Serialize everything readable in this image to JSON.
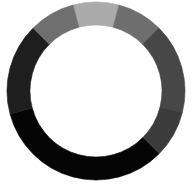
{
  "spinner": {
    "icon": "loading-spinner-icon",
    "center": [
      96,
      91
    ],
    "outer_radius": 89,
    "inner_radius": 66,
    "background": "#ffffff",
    "segments": [
      {
        "start": -15,
        "end": 15,
        "color": "#aaaaaa"
      },
      {
        "start": 15,
        "end": 45,
        "color": "#6e6e6e"
      },
      {
        "start": 45,
        "end": 104,
        "color": "#474747"
      },
      {
        "start": 104,
        "end": 135,
        "color": "#3b3b3b"
      },
      {
        "start": 135,
        "end": 255,
        "color": "#050505"
      },
      {
        "start": 255,
        "end": 315,
        "color": "#1e1e1e"
      },
      {
        "start": 315,
        "end": 345,
        "color": "#6f6f6f"
      }
    ]
  }
}
